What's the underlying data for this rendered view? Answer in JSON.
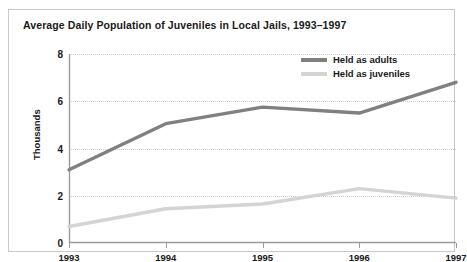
{
  "chart_data": {
    "type": "line",
    "title": "Average Daily Population of Juveniles in Local Jails, 1993–1997",
    "xlabel": "",
    "ylabel": "Thousands",
    "categories": [
      "1993",
      "1994",
      "1995",
      "1996",
      "1997"
    ],
    "x_tick_labels": [
      "1993",
      "1994",
      "1995",
      "1996",
      "1997"
    ],
    "y_tick_labels": [
      "0",
      "2",
      "4",
      "6",
      "8"
    ],
    "y_ticks": [
      0,
      2,
      4,
      6,
      8
    ],
    "ylim": [
      0,
      8
    ],
    "grid": "horizontal-dotted",
    "legend_position": "top-right",
    "series": [
      {
        "name": "Held as adults",
        "color": "#808080",
        "values": [
          3.1,
          5.05,
          5.75,
          5.5,
          6.8
        ]
      },
      {
        "name": "Held as juveniles",
        "color": "#d4d4d4",
        "values": [
          0.7,
          1.45,
          1.65,
          2.3,
          1.9
        ]
      }
    ]
  },
  "colors": {
    "adults_line": "#808080",
    "juveniles_line": "#d4d4d4",
    "axis": "#9a9a9a",
    "grid": "#c9c9d6",
    "text": "#1a1a1a",
    "frame": "#c8c8c8",
    "background": "#ffffff"
  }
}
